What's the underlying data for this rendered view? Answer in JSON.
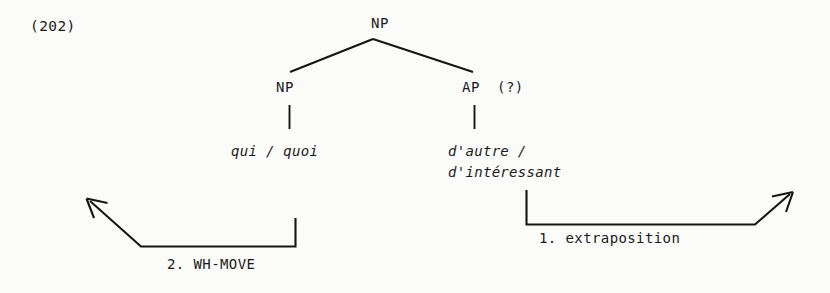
{
  "figure": {
    "example_number": "(202)",
    "kind": "syntax-tree-with-movement-arrows"
  },
  "tree": {
    "root": {
      "label": "NP"
    },
    "daughters": [
      {
        "label": "NP",
        "terminal": "qui / quoi"
      },
      {
        "label": "AP",
        "annotation": "(?)",
        "terminal_line1": "d'autre /",
        "terminal_line2": "d'intéressant"
      }
    ]
  },
  "arrows": [
    {
      "id": "extraposition",
      "label": "1. extraposition",
      "direction": "rightward",
      "source": "AP",
      "ordinal": "1"
    },
    {
      "id": "wh-move",
      "label": "2. WH-MOVE",
      "direction": "leftward",
      "source": "NP",
      "ordinal": "2"
    }
  ],
  "colors": {
    "ink": "#151515",
    "text": "#1a1a1a",
    "page": "#fbfbf9"
  }
}
